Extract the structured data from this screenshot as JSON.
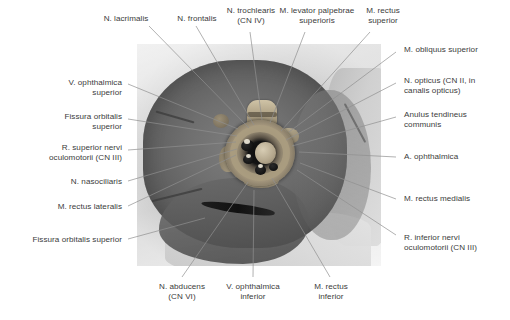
{
  "figure": {
    "type": "anatomical-photograph",
    "photo_style": "grayscale dissection photograph"
  },
  "labels": {
    "top": [
      {
        "id": "n-lacrimalis",
        "text": "N. lacrimalis",
        "align": "center"
      },
      {
        "id": "n-frontalis",
        "text": "N. frontalis",
        "align": "center"
      },
      {
        "id": "n-trochlearis",
        "text": "N. trochlearis\n(CN IV)",
        "align": "center"
      },
      {
        "id": "m-levator-palpebrae-superioris",
        "text": "M. levator palpebrae\nsuperioris",
        "align": "center"
      },
      {
        "id": "m-rectus-superior",
        "text": "M. rectus\nsuperior",
        "align": "center"
      }
    ],
    "right": [
      {
        "id": "m-obliquus-superior",
        "text": "M. obliquus superior",
        "align": "left"
      },
      {
        "id": "n-opticus",
        "text": "N. opticus (CN II, in\ncanalis opticus)",
        "align": "left"
      },
      {
        "id": "anulus-tendineus-communis",
        "text": "Anulus tendineus\ncommunis",
        "align": "left"
      },
      {
        "id": "a-ophthalmica",
        "text": "A. ophthalmica",
        "align": "left"
      },
      {
        "id": "m-rectus-medialis",
        "text": "M. rectus medialis",
        "align": "left"
      },
      {
        "id": "r-inferior-nervi-oculomotorii",
        "text": "R. inferior nervi\noculomotorii (CN III)",
        "align": "left"
      }
    ],
    "left": [
      {
        "id": "v-ophthalmica-superior",
        "text": "V. ophthalmica\nsuperior",
        "align": "right"
      },
      {
        "id": "fissura-orbitalis-superior-1",
        "text": "Fissura orbitalis\nsuperior",
        "align": "right"
      },
      {
        "id": "r-superior-nervi-oculomotorii",
        "text": "R. superior nervi\noculomotorii (CN III)",
        "align": "right"
      },
      {
        "id": "n-nasociliaris",
        "text": "N. nasociliaris",
        "align": "right"
      },
      {
        "id": "m-rectus-lateralis",
        "text": "M. rectus lateralis",
        "align": "right"
      },
      {
        "id": "fissura-orbitalis-superior-2",
        "text": "Fissura orbitalis superior",
        "align": "right"
      }
    ],
    "bottom": [
      {
        "id": "n-abducens",
        "text": "N. abducens\n(CN VI)",
        "align": "center"
      },
      {
        "id": "v-ophthalmica-inferior",
        "text": "V. ophthalmica\ninferior",
        "align": "center"
      },
      {
        "id": "m-rectus-inferior",
        "text": "M. rectus\ninferior",
        "align": "center"
      }
    ]
  },
  "colors": {
    "text": "#3b3b3b",
    "leader_line": "#8f8f8f",
    "background": "#ffffff"
  }
}
